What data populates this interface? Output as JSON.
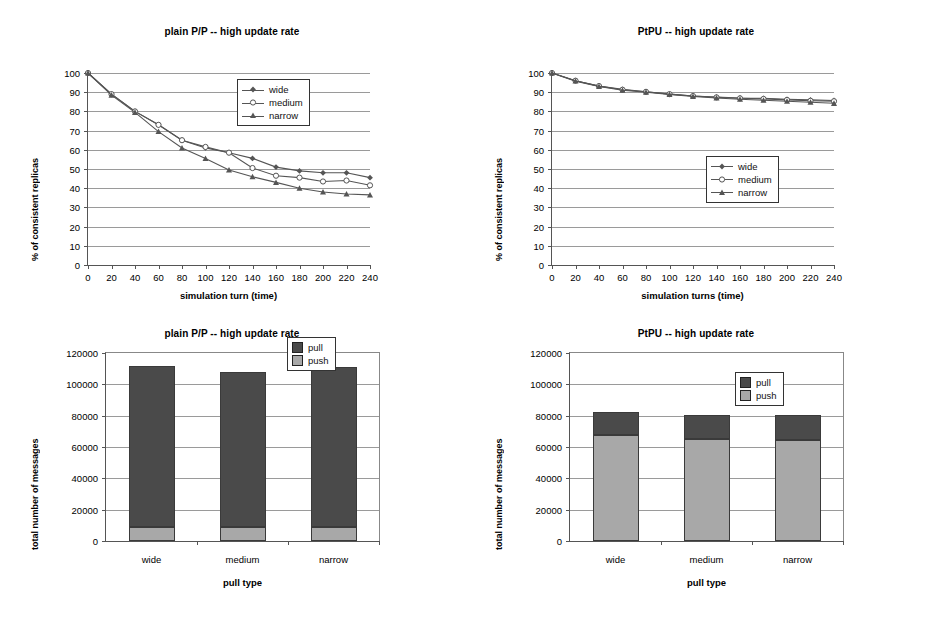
{
  "page": {
    "background": "#ffffff"
  },
  "colors": {
    "pull": "#4a4a4a",
    "push": "#a8a8a8",
    "grid": "#9a9a9a",
    "axis": "#555555",
    "line": "#555555",
    "text": "#000000"
  },
  "panels": [
    {
      "id": "line-plain-pp",
      "title": "plain P/P -- high update rate",
      "ylabel": "% of consistent replicas",
      "xlabel": "simulation turn (time)"
    },
    {
      "id": "line-ptpu",
      "title": "PtPU -- high update rate",
      "ylabel": "% of consistent replicas",
      "xlabel": "simulation turns (time)"
    },
    {
      "id": "bar-plain-pp",
      "title": "plain P/P -- high update rate",
      "ylabel": "total number of messages",
      "xlabel": "pull type"
    },
    {
      "id": "bar-ptpu",
      "title": "PtPU -- high update rate",
      "ylabel": "total number of messages",
      "xlabel": "pull type"
    }
  ],
  "legends": {
    "line": [
      {
        "label": "wide",
        "marker": "diamond"
      },
      {
        "label": "medium",
        "marker": "circle-open"
      },
      {
        "label": "narrow",
        "marker": "triangle"
      }
    ],
    "bar": [
      {
        "label": "pull",
        "color": "#4a4a4a"
      },
      {
        "label": "push",
        "color": "#a8a8a8"
      }
    ]
  },
  "chart_data": [
    {
      "type": "line",
      "id": "line-plain-pp",
      "title": "plain P/P -- high update rate",
      "xlabel": "simulation turn (time)",
      "ylabel": "% of consistent replicas",
      "x": [
        0,
        20,
        40,
        60,
        80,
        100,
        120,
        140,
        160,
        180,
        200,
        220,
        240
      ],
      "xlim": [
        0,
        240
      ],
      "ylim": [
        0,
        100
      ],
      "xticks": [
        0,
        20,
        40,
        60,
        80,
        100,
        120,
        140,
        160,
        180,
        200,
        220,
        240
      ],
      "yticks": [
        0,
        10,
        20,
        30,
        40,
        50,
        60,
        70,
        80,
        90,
        100
      ],
      "grid": "horizontal",
      "legend_position": "top-right",
      "series": [
        {
          "name": "wide",
          "marker": "diamond",
          "values": [
            100,
            89,
            80,
            73,
            65,
            61,
            58.5,
            55.5,
            51,
            49,
            48,
            48,
            45.5
          ]
        },
        {
          "name": "medium",
          "marker": "circle-open",
          "values": [
            100,
            89,
            80,
            73,
            65,
            61.5,
            58.5,
            50.5,
            46.5,
            45.5,
            43.5,
            44,
            41.5
          ]
        },
        {
          "name": "narrow",
          "marker": "triangle",
          "values": [
            100,
            88.5,
            79.5,
            69.5,
            61,
            55.5,
            49.5,
            46,
            43,
            40,
            38,
            37,
            36.5
          ]
        }
      ]
    },
    {
      "type": "line",
      "id": "line-ptpu",
      "title": "PtPU -- high update rate",
      "xlabel": "simulation turns (time)",
      "ylabel": "% of consistent replicas",
      "x": [
        0,
        20,
        40,
        60,
        80,
        100,
        120,
        140,
        160,
        180,
        200,
        220,
        240
      ],
      "xlim": [
        0,
        240
      ],
      "ylim": [
        0,
        100
      ],
      "xticks": [
        0,
        20,
        40,
        60,
        80,
        100,
        120,
        140,
        160,
        180,
        200,
        220,
        240
      ],
      "yticks": [
        0,
        10,
        20,
        30,
        40,
        50,
        60,
        70,
        80,
        90,
        100
      ],
      "grid": "horizontal",
      "legend_position": "middle-right",
      "series": [
        {
          "name": "wide",
          "marker": "diamond",
          "values": [
            100,
            96,
            93.2,
            91.5,
            90.2,
            89,
            88,
            87.5,
            87,
            86.8,
            86.3,
            86,
            85.7
          ]
        },
        {
          "name": "medium",
          "marker": "circle-open",
          "values": [
            100,
            96,
            93.2,
            91.3,
            90.2,
            89,
            88,
            87.3,
            86.8,
            86.5,
            86,
            85.5,
            85.3
          ]
        },
        {
          "name": "narrow",
          "marker": "triangle",
          "values": [
            100,
            95.8,
            93,
            91,
            90,
            88.8,
            87.8,
            87,
            86.3,
            85.8,
            85.3,
            84.8,
            84.2
          ]
        }
      ]
    },
    {
      "type": "bar",
      "subtype": "stacked",
      "id": "bar-plain-pp",
      "title": "plain P/P -- high update rate",
      "xlabel": "pull type",
      "ylabel": "total number of messages",
      "categories": [
        "wide",
        "medium",
        "narrow"
      ],
      "ylim": [
        0,
        120000
      ],
      "yticks": [
        0,
        20000,
        40000,
        60000,
        80000,
        100000,
        120000
      ],
      "grid": "horizontal",
      "legend_position": "top-right",
      "series": [
        {
          "name": "push",
          "color": "#a8a8a8",
          "values": [
            8800,
            9200,
            9200
          ]
        },
        {
          "name": "pull",
          "color": "#4a4a4a",
          "values": [
            103200,
            99000,
            101800
          ]
        }
      ],
      "totals": [
        112000,
        108200,
        111000
      ]
    },
    {
      "type": "bar",
      "subtype": "stacked",
      "id": "bar-ptpu",
      "title": "PtPU -- high update rate",
      "xlabel": "pull type",
      "ylabel": "total number of messages",
      "categories": [
        "wide",
        "medium",
        "narrow"
      ],
      "ylim": [
        0,
        120000
      ],
      "yticks": [
        0,
        20000,
        40000,
        60000,
        80000,
        100000,
        120000
      ],
      "grid": "horizontal",
      "legend_position": "upper-middle-right",
      "series": [
        {
          "name": "push",
          "color": "#a8a8a8",
          "values": [
            67500,
            65300,
            64200
          ]
        },
        {
          "name": "pull",
          "color": "#4a4a4a",
          "values": [
            15000,
            15400,
            16100
          ]
        }
      ],
      "totals": [
        82500,
        80700,
        80300
      ]
    }
  ]
}
